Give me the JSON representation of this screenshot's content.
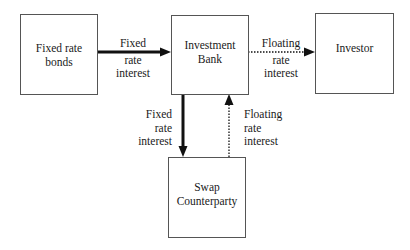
{
  "nodes": {
    "fixed_bonds": {
      "line1": "Fixed rate",
      "line2": "bonds"
    },
    "bank": {
      "line1": "Investment",
      "line2": "Bank"
    },
    "investor": {
      "line1": "Investor"
    },
    "swap": {
      "line1": "Swap",
      "line2": "Counterparty"
    }
  },
  "edges": {
    "bonds_to_bank": {
      "style": "solid-thick",
      "l1": "Fixed",
      "l2": "rate",
      "l3": "interest"
    },
    "bank_to_investor": {
      "style": "dotted",
      "l1": "Floating",
      "l2": "rate",
      "l3": "interest"
    },
    "bank_to_swap": {
      "style": "solid-thick",
      "l1": "Fixed",
      "l2": "rate",
      "l3": "interest"
    },
    "swap_to_bank": {
      "style": "dotted",
      "l1": "Floating",
      "l2": "rate",
      "l3": "interest"
    }
  },
  "colors": {
    "line": "#111111",
    "box_border": "#555555"
  }
}
